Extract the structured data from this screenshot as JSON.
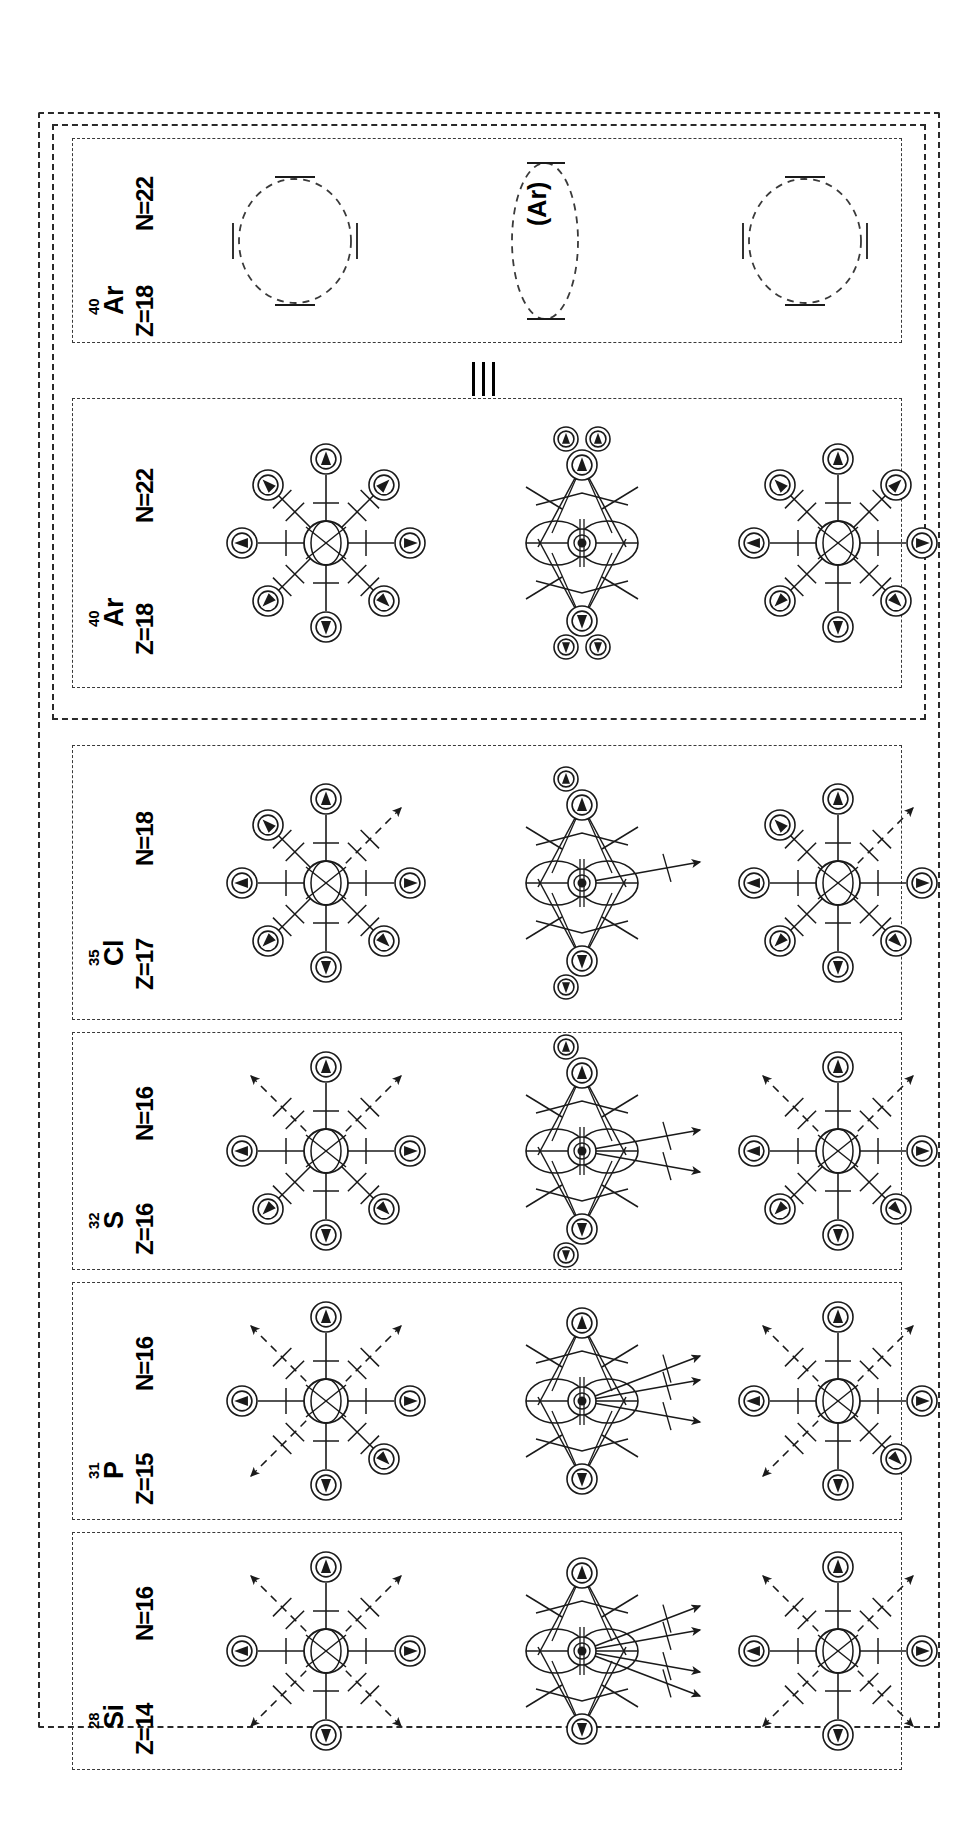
{
  "figure": {
    "orientation": "rotated-90",
    "equivalence_symbol": "identical-to-triple-bar",
    "columns": [
      "left-full-spoke",
      "middle-collapsed",
      "right-partial-spoke"
    ],
    "stroke_color": "#1a1a1a",
    "dash_color": "#3a3a3a"
  },
  "panels": [
    {
      "id": "ar40-schematic",
      "mass": "40",
      "symbol": "Ar",
      "z_label": "Z=18",
      "n_label": "N=22",
      "style": "dashed-outline-only",
      "center_text": "(Ar)",
      "diagrams": [
        {
          "kind": "dashed-circle",
          "label": ""
        },
        {
          "kind": "dashed-ellipse",
          "label": "(Ar)"
        },
        {
          "kind": "dashed-circle",
          "label": ""
        }
      ]
    },
    {
      "id": "ar40-detailed",
      "mass": "40",
      "symbol": "Ar",
      "z_label": "Z=18",
      "n_label": "N=22",
      "style": "full-spokes",
      "center_text": "",
      "diagrams": [
        {
          "kind": "sunburst",
          "label": ""
        },
        {
          "kind": "collapsed",
          "label": ""
        },
        {
          "kind": "sunburst",
          "label": ""
        }
      ]
    },
    {
      "id": "cl35",
      "mass": "35",
      "symbol": "Cl",
      "z_label": "Z=17",
      "n_label": "N=18",
      "style": "one-open-arrow",
      "center_text": "",
      "diagrams": [
        {
          "kind": "sunburst",
          "label": ""
        },
        {
          "kind": "collapsed",
          "label": ""
        },
        {
          "kind": "sunburst",
          "label": ""
        }
      ]
    },
    {
      "id": "s32",
      "mass": "32",
      "symbol": "S",
      "z_label": "Z=16",
      "n_label": "N=16",
      "style": "two-open-arrows",
      "center_text": "",
      "diagrams": [
        {
          "kind": "sunburst",
          "label": ""
        },
        {
          "kind": "collapsed",
          "label": ""
        },
        {
          "kind": "sunburst",
          "label": ""
        }
      ]
    },
    {
      "id": "p31",
      "mass": "31",
      "symbol": "P",
      "z_label": "Z=15",
      "n_label": "N=16",
      "style": "three-open-arrows",
      "center_text": "",
      "diagrams": [
        {
          "kind": "sunburst",
          "label": ""
        },
        {
          "kind": "collapsed",
          "label": ""
        },
        {
          "kind": "sunburst",
          "label": ""
        }
      ]
    },
    {
      "id": "si28",
      "mass": "28",
      "symbol": "Si",
      "z_label": "Z=14",
      "n_label": "N=16",
      "style": "four-open-arrows",
      "center_text": "",
      "diagrams": [
        {
          "kind": "sunburst",
          "label": ""
        },
        {
          "kind": "collapsed",
          "label": ""
        },
        {
          "kind": "sunburst",
          "label": ""
        }
      ]
    }
  ]
}
